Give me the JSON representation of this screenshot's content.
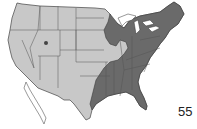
{
  "map": {
    "title": "Range map of the United States",
    "region": "Contiguous United States",
    "colors": {
      "base_land": "#c8c8c8",
      "range": "#6a6a6a",
      "border": "#3a3a3a",
      "water": "#ffffff"
    },
    "range_description": "Eastern United States (dark shading)",
    "range_states": [
      "Maine",
      "New Hampshire",
      "Vermont",
      "Massachusetts",
      "Connecticut",
      "Rhode Island",
      "New York",
      "New Jersey",
      "Pennsylvania",
      "Delaware",
      "Maryland",
      "West Virginia",
      "Virginia",
      "North Carolina",
      "South Carolina",
      "Georgia",
      "Florida",
      "Alabama",
      "Mississippi",
      "Tennessee",
      "Kentucky",
      "Ohio",
      "Indiana",
      "Michigan",
      "Wisconsin",
      "Minnesota",
      "Louisiana",
      "Arkansas",
      "Missouri",
      "Oklahoma",
      "Texas"
    ]
  },
  "page": {
    "number": "55"
  }
}
